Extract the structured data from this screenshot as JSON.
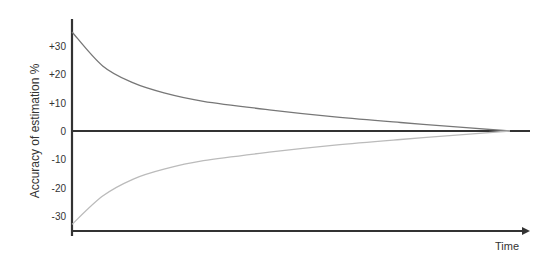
{
  "chart_data": {
    "type": "line",
    "title": "",
    "xlabel": "Time",
    "ylabel": "Accuracy of estimation %",
    "ytick_labels": [
      "+30",
      "+20",
      "+10",
      "0",
      "-10",
      "-20",
      "-30"
    ],
    "ytick_values": [
      30,
      20,
      10,
      0,
      -10,
      -20,
      -30
    ],
    "ylim": [
      -35,
      40
    ],
    "xlim": [
      0,
      100
    ],
    "grid": false,
    "legend": "none",
    "x": [
      0,
      7,
      14,
      21,
      30,
      45,
      60,
      75,
      90,
      100
    ],
    "series": [
      {
        "name": "upper bound",
        "color": "#777777",
        "values": [
          35,
          23,
          17,
          13.5,
          10.5,
          7.5,
          5,
          3,
          1.2,
          0
        ]
      },
      {
        "name": "lower bound",
        "color": "#bbbbbb",
        "values": [
          -33,
          -23,
          -17,
          -13.5,
          -10.5,
          -7.5,
          -5,
          -3,
          -1.2,
          0
        ]
      }
    ],
    "reference_lines": [
      {
        "name": "zero line",
        "y": 0,
        "color": "#333333"
      }
    ]
  }
}
